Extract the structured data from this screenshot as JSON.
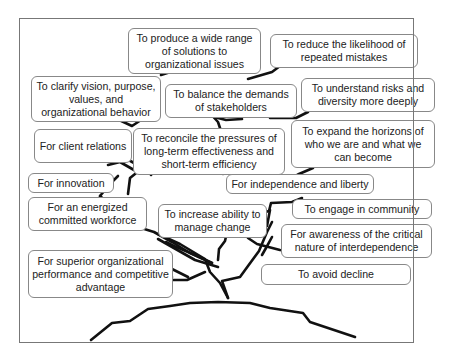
{
  "diagram": {
    "type": "tree",
    "colors": {
      "branch": "#111111",
      "box_border": "#888888",
      "frame": "#777777",
      "text": "#222222"
    },
    "boxes": [
      {
        "id": "b1",
        "text": "To produce a wide range of solutions to organizational issues"
      },
      {
        "id": "b2",
        "text": "To reduce the likelihood of repeated mistakes"
      },
      {
        "id": "b3",
        "text": "To clarify vision, purpose, values, and organizational behavior"
      },
      {
        "id": "b4",
        "text": "To balance the demands of stakeholders"
      },
      {
        "id": "b5",
        "text": "To understand risks and diversity more deeply"
      },
      {
        "id": "b6",
        "text": "For client relations"
      },
      {
        "id": "b7",
        "text": "To reconcile the pressures of long-term effectiveness and short-term efficiency"
      },
      {
        "id": "b8",
        "text": "To expand the horizons of who we are and what we can become"
      },
      {
        "id": "b9",
        "text": "For innovation"
      },
      {
        "id": "b10",
        "text": "For independence and liberty"
      },
      {
        "id": "b11",
        "text": "For an energized committed workforce"
      },
      {
        "id": "b12",
        "text": "To increase ability to manage change"
      },
      {
        "id": "b13",
        "text": "To engage in community"
      },
      {
        "id": "b14",
        "text": "For awareness of the critical nature of interdependence"
      },
      {
        "id": "b15",
        "text": "For superior organizational performance and competitive advantage"
      },
      {
        "id": "b16",
        "text": "To avoid decline"
      }
    ]
  }
}
